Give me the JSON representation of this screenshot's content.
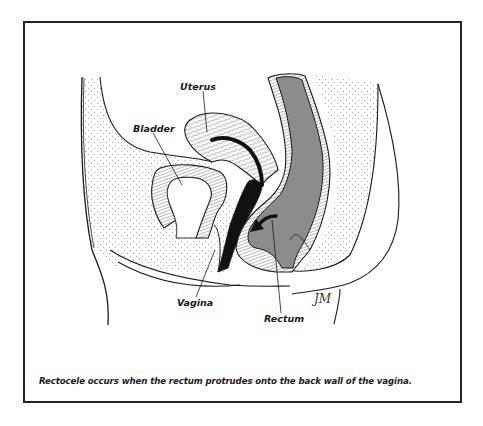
{
  "figure": {
    "caption": "Rectocele occurs when the rectum protrudes onto the back wall of the vagina.",
    "labels": {
      "uterus": "Uterus",
      "bladder": "Bladder",
      "vagina": "Vagina",
      "rectum": "Rectum"
    },
    "signature": "JM",
    "colors": {
      "frame": "#222222",
      "outline": "#1a1a1a",
      "rectum_fill": "#8c8c8c",
      "tissue_fill": "#f4f4f4",
      "vagina_fill": "#111111",
      "background": "#ffffff"
    },
    "icons": {
      "arrow": "curved-arrow-left-down"
    }
  }
}
